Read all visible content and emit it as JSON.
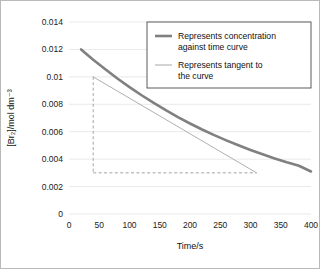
{
  "chart_data": {
    "type": "line",
    "title": "",
    "xlabel": "Time/s",
    "ylabel": "[Br2]/mol dm-3",
    "ylabel_display": "[Br₂]/mol dm⁻³",
    "xlim": [
      0,
      400
    ],
    "ylim": [
      0,
      0.014
    ],
    "xticks": [
      0,
      50,
      100,
      150,
      200,
      250,
      300,
      350,
      400
    ],
    "yticks": [
      0,
      0.002,
      0.004,
      0.006,
      0.008,
      0.01,
      0.012,
      0.014
    ],
    "xticklabels": [
      "0",
      "50",
      "100",
      "150",
      "200",
      "250",
      "300",
      "350",
      "400"
    ],
    "yticklabels": [
      "0",
      "0.002",
      "0.004",
      "0.006",
      "0.008",
      "0.01",
      "0.012",
      "0.014"
    ],
    "grid": "horizontal",
    "legend_position": "top-right",
    "series": [
      {
        "name": "concentration-curve",
        "label": "Represents concentration against time curve",
        "color": "#808080",
        "width": 2.6,
        "x": [
          20,
          40,
          60,
          80,
          100,
          120,
          140,
          160,
          180,
          200,
          220,
          240,
          260,
          280,
          300,
          320,
          340,
          360,
          380,
          400
        ],
        "y": [
          0.012,
          0.01125,
          0.01055,
          0.00988,
          0.00925,
          0.00866,
          0.0081,
          0.00757,
          0.00707,
          0.0066,
          0.00616,
          0.00575,
          0.00537,
          0.00501,
          0.00467,
          0.00435,
          0.00405,
          0.00377,
          0.00352,
          0.0031
        ]
      },
      {
        "name": "tangent-line",
        "label": "Represents tangent to the curve",
        "color": "#b0b0b0",
        "width": 1.0,
        "x": [
          40,
          310
        ],
        "y": [
          0.01,
          0.003
        ]
      }
    ],
    "construction_lines": [
      {
        "name": "vertical-dashed",
        "x": [
          40,
          40
        ],
        "y": [
          0.01,
          0.003
        ],
        "style": "dashed",
        "color": "#9a9a9a"
      },
      {
        "name": "horizontal-dashed",
        "x": [
          40,
          310
        ],
        "y": [
          0.003,
          0.003
        ],
        "style": "dashed",
        "color": "#9a9a9a"
      }
    ]
  },
  "legend": {
    "entries": [
      {
        "label": "Represents concentration against time curve",
        "line1": "Represents concentration",
        "line2": "against time curve",
        "color": "#808080"
      },
      {
        "label": "Represents tangent to the curve",
        "line1": "Represents tangent to",
        "line2": "the curve",
        "color": "#b0b0b0"
      }
    ]
  },
  "axes": {
    "x_title": "Time/s",
    "y_title": "[Br₂]/mol dm⁻³"
  }
}
